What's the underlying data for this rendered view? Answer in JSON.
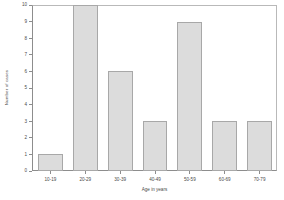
{
  "chart_data": {
    "type": "bar",
    "title": "",
    "subtitle": "",
    "xlabel": "Age in years",
    "ylabel": "Number of cases",
    "categories": [
      "10-19",
      "20-29",
      "30-39",
      "40-49",
      "50-59",
      "60-69",
      "70-79"
    ],
    "values": [
      1,
      10,
      6,
      3,
      9,
      3,
      3
    ],
    "ylim": [
      0,
      10
    ],
    "ytick_labels": [
      "0",
      "1",
      "2",
      "3",
      "4",
      "5",
      "6",
      "7",
      "8",
      "9",
      "10"
    ],
    "ytick_values": [
      0,
      1,
      2,
      3,
      4,
      5,
      6,
      7,
      8,
      9,
      10
    ],
    "grid": false,
    "legend": false,
    "legend_position": "none",
    "bar_fill_color": "#dcdcdc",
    "bar_border_color": "#a8a8a8",
    "axis_color": "#8d8d8d",
    "background_color": "#ffffff",
    "annotations": []
  }
}
